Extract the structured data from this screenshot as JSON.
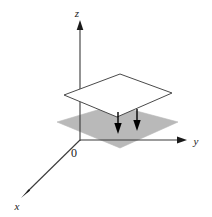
{
  "figure": {
    "background_color": "#ffffff",
    "width": 212,
    "height": 217,
    "line_color": "#3a3a3a",
    "arrow_color": "#000000",
    "upper_plane_fill": "#ffffff",
    "upper_plane_stroke": "#4a4a4a",
    "lower_plane_fill": "#b9b9b9",
    "lower_plane_stroke": "#b9b9b9"
  },
  "axes": {
    "z": {
      "label": "z",
      "label_x": 78,
      "label_y": 16,
      "line": {
        "x1": 80,
        "y1": 140,
        "x2": 80,
        "y2": 26
      },
      "arrow_tip": {
        "x": 80,
        "y": 21
      }
    },
    "y": {
      "label": "y",
      "label_x": 196,
      "label_y": 144,
      "line": {
        "x1": 80,
        "y1": 140,
        "x2": 178,
        "y2": 140
      },
      "arrow_tip": {
        "x": 186,
        "y": 140
      }
    },
    "x": {
      "label": "x",
      "label_x": 17,
      "label_y": 209,
      "line": {
        "x1": 80,
        "y1": 140,
        "x2": 27,
        "y2": 192
      },
      "arrow_tip": {
        "x": 21,
        "y": 198
      }
    }
  },
  "origin": {
    "label": "0",
    "label_x": 75,
    "label_y": 155
  },
  "upper_plane": {
    "name": "upper-plane",
    "points": "64,95 120,74 172,93 117,117"
  },
  "lower_plane": {
    "name": "lower-plane",
    "points": "57,122 114,105 178,122 120,148"
  },
  "down_arrows": [
    {
      "x": 118,
      "y_top": 113,
      "y_bottom": 133
    },
    {
      "x": 137,
      "y_top": 110,
      "y_bottom": 130
    }
  ]
}
